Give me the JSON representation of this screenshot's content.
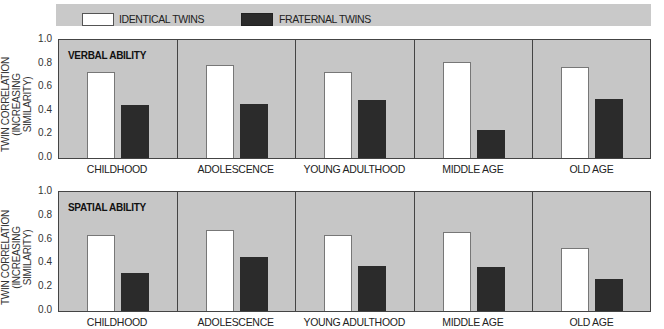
{
  "legend": {
    "identical_label": "IDENTICAL TWINS",
    "fraternal_label": "FRATERNAL TWINS",
    "identical_color": "#ffffff",
    "fraternal_color": "#2b2b2b"
  },
  "y_axis": {
    "label_line1": "TWIN CORRELATION",
    "label_line2": "(INCREASING SIMILARITY)",
    "ticks": [
      "1.0",
      "0.8",
      "0.6",
      "0.4",
      "0.2",
      "0.0"
    ]
  },
  "panels": [
    {
      "title": "VERBAL ABILITY",
      "categories": [
        "CHILDHOOD",
        "ADOLESCENCE",
        "YOUNG ADULTHOOD",
        "MIDDLE AGE",
        "OLD AGE"
      ]
    },
    {
      "title": "SPATIAL ABILITY",
      "categories": [
        "CHILDHOOD",
        "ADOLESCENCE",
        "YOUNG ADULTHOOD",
        "MIDDLE AGE",
        "OLD AGE"
      ]
    }
  ],
  "chart_data": [
    {
      "type": "bar",
      "title": "VERBAL ABILITY",
      "categories": [
        "CHILDHOOD",
        "ADOLESCENCE",
        "YOUNG ADULTHOOD",
        "MIDDLE AGE",
        "OLD AGE"
      ],
      "series": [
        {
          "name": "IDENTICAL TWINS",
          "values": [
            0.73,
            0.79,
            0.73,
            0.81,
            0.77
          ]
        },
        {
          "name": "FRATERNAL TWINS",
          "values": [
            0.45,
            0.46,
            0.49,
            0.24,
            0.5
          ]
        }
      ],
      "xlabel": "",
      "ylabel": "TWIN CORRELATION (INCREASING SIMILARITY)",
      "ylim": [
        0,
        1.0
      ],
      "yticks": [
        0.0,
        0.2,
        0.4,
        0.6,
        0.8,
        1.0
      ],
      "grid": false,
      "legend_position": "top"
    },
    {
      "type": "bar",
      "title": "SPATIAL ABILITY",
      "categories": [
        "CHILDHOOD",
        "ADOLESCENCE",
        "YOUNG ADULTHOOD",
        "MIDDLE AGE",
        "OLD AGE"
      ],
      "series": [
        {
          "name": "IDENTICAL TWINS",
          "values": [
            0.64,
            0.68,
            0.64,
            0.66,
            0.53
          ]
        },
        {
          "name": "FRATERNAL TWINS",
          "values": [
            0.32,
            0.45,
            0.38,
            0.37,
            0.27
          ]
        }
      ],
      "xlabel": "",
      "ylabel": "TWIN CORRELATION (INCREASING SIMILARITY)",
      "ylim": [
        0,
        1.0
      ],
      "yticks": [
        0.0,
        0.2,
        0.4,
        0.6,
        0.8,
        1.0
      ],
      "grid": false,
      "legend_position": "top"
    }
  ]
}
